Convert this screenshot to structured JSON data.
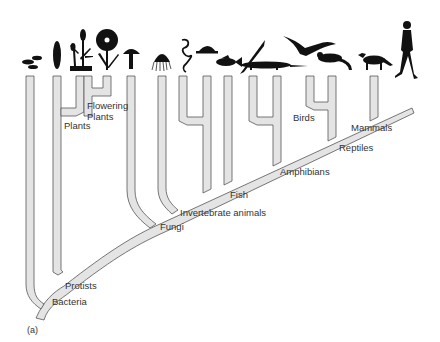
{
  "figure": {
    "panel_label": "(a)",
    "type": "phylogenetic tree of life",
    "colors": {
      "branch_fill": "#e4e4e4",
      "branch_stroke": "#555555",
      "silhouette": "#111111",
      "label": "#333333"
    }
  },
  "labels": {
    "bacteria": "Bacteria",
    "protists": "Protists",
    "plants": "Plants",
    "flowering_plants_line1": "Flowering",
    "flowering_plants_line2": "Plants",
    "fungi": "Fungi",
    "invertebrate_animals": "Invertebrate animals",
    "fish": "Fish",
    "amphibians": "Amphibians",
    "birds": "Birds",
    "reptiles": "Reptiles",
    "mammals": "Mammals"
  },
  "silhouettes": [
    "bacteria-icon",
    "protist-icon",
    "moss-plant-icon",
    "flower-icon",
    "mushroom-icon",
    "jellyfish-icon",
    "worm-icon",
    "snail-icon",
    "fish-icon",
    "lizard-icon",
    "salamander-icon",
    "bird-icon",
    "reptile-icon",
    "wolf-icon",
    "human-icon"
  ]
}
